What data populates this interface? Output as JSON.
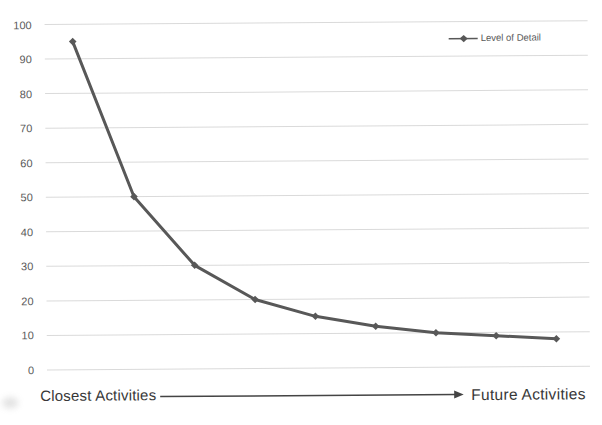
{
  "chart_data": {
    "type": "line",
    "title": "",
    "xlabel_left": "Closest Activities",
    "xlabel_right": "Future Activities",
    "ylabel": "",
    "ylim": [
      0,
      100
    ],
    "yticks": [
      0,
      10,
      20,
      30,
      40,
      50,
      60,
      70,
      80,
      90,
      100
    ],
    "grid": true,
    "legend_position": "top-right",
    "marker": "diamond",
    "series": [
      {
        "name": "Level of Detail",
        "values": [
          95,
          50,
          30,
          20,
          15,
          12,
          10,
          9,
          8
        ]
      }
    ]
  },
  "colors": {
    "line": "#585858",
    "grid": "#dadada",
    "tick_label": "#595959",
    "axis_label": "#383838",
    "arrow": "#444444",
    "background": "#ffffff"
  }
}
